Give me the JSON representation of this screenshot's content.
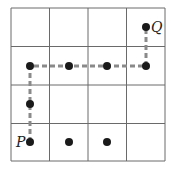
{
  "diagram": {
    "type": "grid-path",
    "grid": {
      "rows": 4,
      "cols": 4
    },
    "labels": {
      "start": "P",
      "end": "Q"
    },
    "points": [
      {
        "col": 0,
        "row": 0
      },
      {
        "col": 1,
        "row": 0
      },
      {
        "col": 2,
        "row": 0
      },
      {
        "col": 0,
        "row": 1
      },
      {
        "col": 0,
        "row": 2
      },
      {
        "col": 1,
        "row": 2
      },
      {
        "col": 2,
        "row": 2
      },
      {
        "col": 3,
        "row": 2
      },
      {
        "col": 3,
        "row": 3
      }
    ],
    "path": [
      {
        "col": 0,
        "row": 0
      },
      {
        "col": 0,
        "row": 2
      },
      {
        "col": 3,
        "row": 2
      },
      {
        "col": 3,
        "row": 3
      }
    ],
    "colors": {
      "grid": "#6a6a6a",
      "path": "#8a8a8a",
      "point": "#1a1a1a"
    }
  }
}
